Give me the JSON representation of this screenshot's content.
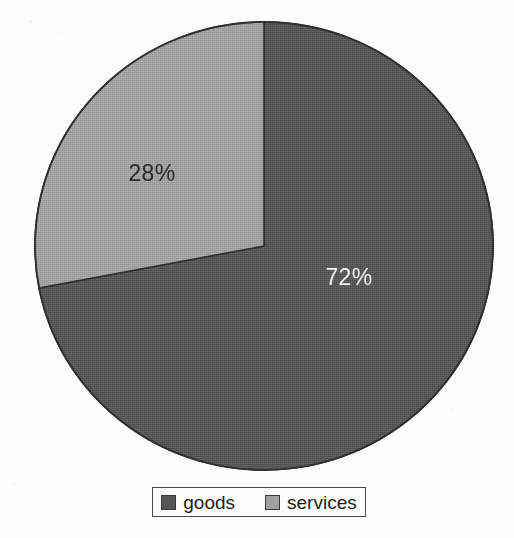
{
  "chart_data": {
    "type": "pie",
    "title": "",
    "subtitle": "",
    "xlabel": "",
    "ylabel": "",
    "categories": [
      "goods",
      "services"
    ],
    "values": [
      72,
      28
    ],
    "unit": "%",
    "data_labels": [
      "72%",
      "28%"
    ],
    "colors": [
      "#565656",
      "#a0a0a0"
    ],
    "legend_position": "bottom",
    "grid": false,
    "start_angle_deg": 0,
    "direction": "clockwise",
    "slices": [
      {
        "name": "goods",
        "value": 72,
        "label": "72%",
        "color": "#565656",
        "label_color": "#f2f2f2",
        "start_angle_deg": 0,
        "end_angle_deg": 259.2
      },
      {
        "name": "services",
        "value": 28,
        "label": "28%",
        "color": "#a0a0a0",
        "label_color": "#2a2a2a",
        "start_angle_deg": 259.2,
        "end_angle_deg": 360
      }
    ]
  },
  "pie": {
    "center_x": 264,
    "center_y": 246,
    "radius_x": 229,
    "radius_y": 224,
    "outline_color": "#2f2f2f",
    "labels": {
      "goods": "72%",
      "services": "28%"
    }
  },
  "legend": {
    "items": [
      {
        "label": "goods",
        "color": "#565656"
      },
      {
        "label": "services",
        "color": "#a0a0a0"
      }
    ]
  },
  "page": {
    "background": "#fdfdfd"
  }
}
